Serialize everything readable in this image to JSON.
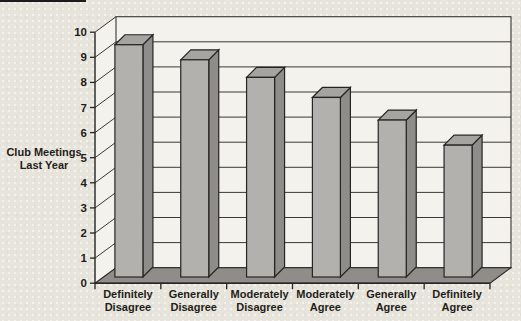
{
  "chart_data": {
    "type": "bar",
    "style": "3d-column",
    "title": "",
    "categories": [
      "Definitely Disagree",
      "Generally Disagree",
      "Moderately Disagree",
      "Moderately Agree",
      "Generally Agree",
      "Definitely Agree"
    ],
    "values": [
      9.5,
      8.9,
      8.2,
      7.4,
      6.5,
      5.5
    ],
    "xlabel": "",
    "ylabel": "Club Meetings Last Year",
    "ylabel_lines": [
      "Club Meetings",
      "Last Year"
    ],
    "ylim": [
      0,
      10
    ],
    "yticks": [
      0,
      1,
      2,
      3,
      4,
      5,
      6,
      7,
      8,
      9,
      10
    ],
    "grid": "horizontal",
    "legend": "none",
    "colors": {
      "page_background": "#e7e4dc",
      "wall": "#f4f2ec",
      "floor": "#8f8d89",
      "bar_front": "#b3b1ad",
      "bar_top": "#a6a4a0",
      "bar_side": "#8f8d89",
      "gridline": "#3a3834",
      "outline": "#262522",
      "text": "#1f1e1b"
    }
  }
}
